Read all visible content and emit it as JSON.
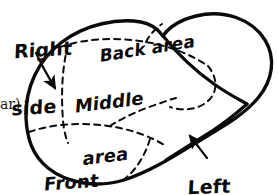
{
  "figure": {
    "kind": "hand-drawn-diagram",
    "background_color": "#ffffff",
    "ink_color": "#0a0a0a",
    "outline_style": "solid",
    "subdivision_style": "dashed",
    "width": 278,
    "height": 195
  },
  "labels": {
    "right_side": {
      "text": "Right side",
      "line1": "Right",
      "line2": "side",
      "has_arrow": true,
      "arrow_points_to": "outer-left-boundary"
    },
    "back_area": {
      "text": "Back area",
      "line1": "Back area",
      "has_arrow": false,
      "region": "upper-rear-zone"
    },
    "middle_area": {
      "text": "Middle area",
      "line1": "Middle",
      "line2": "area",
      "has_arrow": false,
      "region": "central-zone"
    },
    "front_tip": {
      "text": "Front tip",
      "line1": "Front",
      "line2": "tip",
      "has_arrow": false,
      "region": "lower-left-zone"
    },
    "left_side": {
      "text": "Left side",
      "line1": "Left",
      "line2": "side",
      "has_arrow": true,
      "arrow_points_to": "lower-right-boundary"
    }
  },
  "caption_fragment": {
    "text": "ar)",
    "note": "clipped typeset text at left page margin"
  },
  "icons": {
    "arrow_right_side": "arrow-icon",
    "arrow_left_side": "arrow-icon"
  }
}
